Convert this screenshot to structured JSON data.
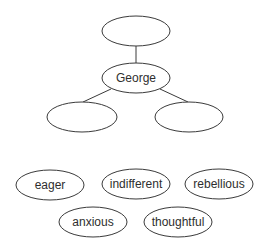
{
  "diagram": {
    "stroke_color": "#3a3a3a",
    "text_color": "#2e2e2e",
    "background": "#ffffff",
    "tree": {
      "top_node": {
        "label": "",
        "cx": 136,
        "cy": 31,
        "rx": 34,
        "ry": 15
      },
      "center_node": {
        "label": "George",
        "cx": 136,
        "cy": 78,
        "rx": 34,
        "ry": 15
      },
      "left_child": {
        "label": "",
        "cx": 82,
        "cy": 117,
        "rx": 35,
        "ry": 15
      },
      "right_child": {
        "label": "",
        "cx": 189,
        "cy": 117,
        "rx": 34,
        "ry": 15
      }
    },
    "word_bank": [
      {
        "label": "eager",
        "cx": 50,
        "cy": 185,
        "rx": 34,
        "ry": 15
      },
      {
        "label": "indifferent",
        "cx": 136,
        "cy": 184,
        "rx": 34,
        "ry": 15
      },
      {
        "label": "rebellious",
        "cx": 219,
        "cy": 184,
        "rx": 34,
        "ry": 15
      },
      {
        "label": "anxious",
        "cx": 93,
        "cy": 222,
        "rx": 34,
        "ry": 15
      },
      {
        "label": "thoughtful",
        "cx": 178,
        "cy": 222,
        "rx": 34,
        "ry": 15
      }
    ]
  }
}
